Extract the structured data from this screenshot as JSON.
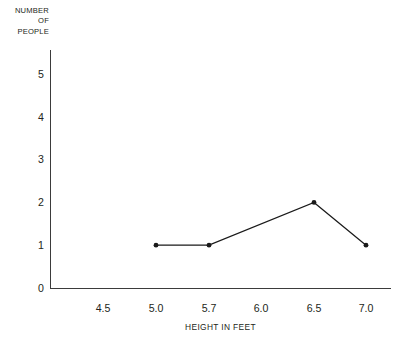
{
  "chart_data": {
    "type": "line",
    "title": "",
    "subtitle": "",
    "xlabel": "HEIGHT IN FEET",
    "ylabel": "NUMBER OF PEOPLE",
    "ylabel_lines": [
      "NUMBER",
      "OF",
      "PEOPLE"
    ],
    "xtick_labels": [
      "4.5",
      "5.0",
      "5.7",
      "6.0",
      "6.5",
      "7.0"
    ],
    "ytick_labels": [
      "0",
      "1",
      "2",
      "3",
      "4",
      "5"
    ],
    "xlim": [
      4.25,
      7.25
    ],
    "ylim": [
      0,
      5.6
    ],
    "grid": false,
    "legend": false,
    "legend_position": "none",
    "series": [
      {
        "name": "people",
        "x": [
          "5.0",
          "5.7",
          "6.5",
          "7.0"
        ],
        "values": [
          1,
          1,
          2,
          1
        ],
        "line_color": "#1a1a1a",
        "marker": "circle",
        "marker_color": "#1a1a1a"
      }
    ],
    "points": [
      {
        "x": "5.0",
        "y": 1
      },
      {
        "x": "5.7",
        "y": 1
      },
      {
        "x": "6.5",
        "y": 2
      },
      {
        "x": "7.0",
        "y": 1
      }
    ],
    "axis_color": "#3b3b3b",
    "background_color": "#ffffff",
    "text_color": "#231f20"
  },
  "geometry": {
    "xtick_centers": [
      103,
      156,
      209,
      261,
      314,
      366
    ],
    "ytick_baselines": [
      288,
      245,
      202,
      159,
      117,
      74
    ],
    "axis_origin": {
      "x": 50,
      "y": 288
    },
    "axis_top": 50,
    "axis_right": 391,
    "marker_radius": 2.4,
    "line_width": 1.25,
    "polyline": "155,244 208,244 314,202 366,245"
  }
}
